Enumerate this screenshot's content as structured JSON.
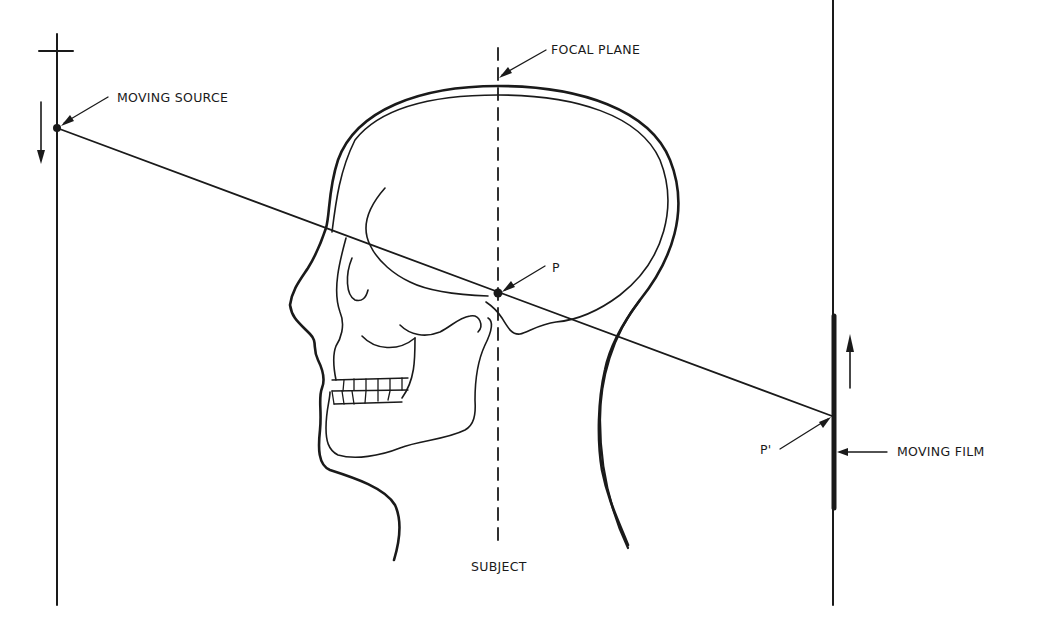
{
  "diagram": {
    "type": "tomography-principle",
    "labels": {
      "moving_source": "MOVING SOURCE",
      "focal_plane": "FOCAL PLANE",
      "point": "P",
      "point_image": "P'",
      "moving_film": "MOVING FILM",
      "subject": "SUBJECT"
    },
    "colors": {
      "ink": "#1a1a1a",
      "background": "#ffffff"
    },
    "elements": {
      "source_track": "vertical line with crossbar at top, source dot, downward arrow",
      "film_track": "vertical line with thick film segment, upward arrow",
      "focal_plane_line": "dashed vertical line through subject",
      "ray": "straight line from source through P to P' on film",
      "subject": "profile of human head showing skull"
    }
  }
}
